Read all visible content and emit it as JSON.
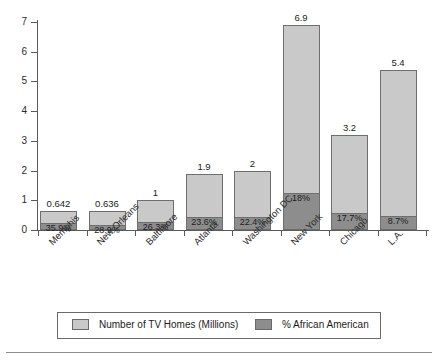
{
  "chart_data": {
    "type": "bar",
    "subtype": "stacked-bar",
    "title": "",
    "xlabel": "",
    "ylabel": "",
    "ylim": [
      0,
      7
    ],
    "yticks": [
      "0",
      "1",
      "2",
      "3",
      "4",
      "5",
      "6",
      "7"
    ],
    "grid": false,
    "legend_position": "bottom",
    "categories": [
      "Memphis",
      "New Orleans",
      "Baltimore",
      "Atlanta",
      "Washington DC",
      "New York",
      "Chicago",
      "L.A."
    ],
    "series": [
      {
        "name": "Number of TV Homes (Millions)",
        "color": "#c9c9c9",
        "values": [
          0.642,
          0.636,
          1,
          1.9,
          2,
          6.9,
          3.2,
          5.4
        ],
        "labels": [
          "0.642",
          "0.636",
          "1",
          "1.9",
          "2",
          "6.9",
          "3.2",
          "5.4"
        ]
      },
      {
        "name": "% African American",
        "color": "#8d8d8d",
        "values": [
          35.9,
          28.9,
          26.3,
          23.6,
          22.4,
          18,
          17.7,
          8.7
        ],
        "labels": [
          "35.9%",
          "28.9%",
          "26.3%",
          "23.6%",
          "22.4%",
          "18%",
          "17.7%",
          "8.7%"
        ]
      }
    ]
  },
  "legend": {
    "entries": [
      {
        "label": "Number of TV Homes (Millions)",
        "color": "#c9c9c9"
      },
      {
        "label": "% African American",
        "color": "#8d8d8d"
      }
    ]
  }
}
